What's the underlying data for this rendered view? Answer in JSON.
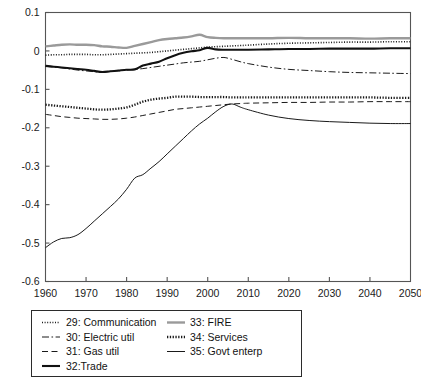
{
  "chart_data": {
    "type": "line",
    "title": "",
    "xlabel": "",
    "ylabel": "",
    "xlim": [
      1960,
      2050
    ],
    "ylim": [
      -0.6,
      0.1
    ],
    "grid": false,
    "legend_position": "below-left",
    "x_ticks": [
      "1960",
      "1970",
      "1980",
      "1990",
      "2000",
      "2010",
      "2020",
      "2030",
      "2040",
      "2050"
    ],
    "x_tick_values": [
      1960,
      1970,
      1980,
      1990,
      2000,
      2010,
      2020,
      2030,
      2040,
      2050
    ],
    "y_ticks": [
      "0.1",
      "0",
      "-0.1",
      "-0.2",
      "-0.3",
      "-0.4",
      "-0.5",
      "-0.6"
    ],
    "y_tick_values": [
      0.1,
      0,
      -0.1,
      -0.2,
      -0.3,
      -0.4,
      -0.5,
      -0.6
    ],
    "x": [
      1960,
      1962,
      1964,
      1966,
      1968,
      1970,
      1972,
      1974,
      1976,
      1978,
      1980,
      1982,
      1984,
      1986,
      1988,
      1990,
      1992,
      1994,
      1996,
      1998,
      2000,
      2002,
      2004,
      2006,
      2008,
      2010,
      2015,
      2020,
      2025,
      2030,
      2035,
      2040,
      2045,
      2050
    ],
    "series": [
      {
        "name": "29: Communication",
        "key": "communication",
        "style": "dotted-fine",
        "color": "#1a1a1a",
        "width": 1.6,
        "dash": "1,1.6",
        "values": [
          -0.011,
          -0.01,
          -0.01,
          -0.009,
          -0.009,
          -0.009,
          -0.01,
          -0.01,
          -0.009,
          -0.008,
          -0.007,
          -0.006,
          -0.005,
          -0.004,
          -0.002,
          0.0,
          0.002,
          0.004,
          0.006,
          0.008,
          0.01,
          0.011,
          0.012,
          0.013,
          0.014,
          0.015,
          0.018,
          0.02,
          0.021,
          0.022,
          0.023,
          0.023,
          0.024,
          0.024
        ]
      },
      {
        "name": "30: Electric util",
        "key": "electric_util",
        "style": "dash-dot",
        "color": "#1a1a1a",
        "width": 1.0,
        "dash": "7,2.5,1.6,2.5",
        "values": [
          -0.04,
          -0.042,
          -0.044,
          -0.047,
          -0.05,
          -0.052,
          -0.054,
          -0.055,
          -0.053,
          -0.052,
          -0.05,
          -0.048,
          -0.046,
          -0.043,
          -0.04,
          -0.037,
          -0.034,
          -0.031,
          -0.029,
          -0.027,
          -0.023,
          -0.019,
          -0.017,
          -0.022,
          -0.028,
          -0.033,
          -0.042,
          -0.048,
          -0.051,
          -0.054,
          -0.056,
          -0.057,
          -0.058,
          -0.059
        ]
      },
      {
        "name": "31: Gas util",
        "key": "gas_util",
        "style": "dashed",
        "color": "#1a1a1a",
        "width": 1.0,
        "dash": "6,3.5",
        "values": [
          -0.165,
          -0.168,
          -0.171,
          -0.173,
          -0.175,
          -0.176,
          -0.177,
          -0.178,
          -0.178,
          -0.177,
          -0.175,
          -0.172,
          -0.168,
          -0.164,
          -0.16,
          -0.156,
          -0.152,
          -0.15,
          -0.148,
          -0.146,
          -0.144,
          -0.142,
          -0.14,
          -0.138,
          -0.137,
          -0.136,
          -0.135,
          -0.134,
          -0.134,
          -0.133,
          -0.133,
          -0.132,
          -0.132,
          -0.132
        ]
      },
      {
        "name": "32:Trade",
        "key": "trade",
        "style": "solid-thick",
        "color": "#111111",
        "width": 2.1,
        "dash": "",
        "values": [
          -0.039,
          -0.041,
          -0.043,
          -0.045,
          -0.047,
          -0.049,
          -0.052,
          -0.055,
          -0.053,
          -0.051,
          -0.049,
          -0.048,
          -0.038,
          -0.033,
          -0.028,
          -0.019,
          -0.011,
          -0.005,
          -0.001,
          0.002,
          0.008,
          0.004,
          0.003,
          0.003,
          0.003,
          0.003,
          0.004,
          0.005,
          0.005,
          0.006,
          0.006,
          0.006,
          0.007,
          0.007
        ]
      },
      {
        "name": "33: FIRE",
        "key": "fire",
        "style": "solid-gray-thick",
        "color": "#9a9a9a",
        "width": 2.4,
        "dash": "",
        "values": [
          0.012,
          0.014,
          0.016,
          0.017,
          0.016,
          0.016,
          0.015,
          0.012,
          0.011,
          0.009,
          0.008,
          0.013,
          0.018,
          0.023,
          0.028,
          0.031,
          0.033,
          0.035,
          0.038,
          0.042,
          0.036,
          0.034,
          0.033,
          0.033,
          0.033,
          0.033,
          0.033,
          0.034,
          0.033,
          0.033,
          0.033,
          0.032,
          0.033,
          0.033
        ]
      },
      {
        "name": "34: Services",
        "key": "services",
        "style": "dotted-bold",
        "color": "#1a1a1a",
        "width": 2.3,
        "dash": "1.3,1.5",
        "values": [
          -0.14,
          -0.142,
          -0.144,
          -0.146,
          -0.148,
          -0.15,
          -0.152,
          -0.153,
          -0.152,
          -0.15,
          -0.147,
          -0.14,
          -0.132,
          -0.127,
          -0.124,
          -0.122,
          -0.119,
          -0.119,
          -0.119,
          -0.12,
          -0.12,
          -0.12,
          -0.12,
          -0.121,
          -0.121,
          -0.121,
          -0.121,
          -0.121,
          -0.121,
          -0.121,
          -0.121,
          -0.121,
          -0.122,
          -0.122
        ]
      },
      {
        "name": "35: Govt enterp",
        "key": "govt_enterp",
        "style": "solid-thin",
        "color": "#1a1a1a",
        "width": 1.0,
        "dash": "",
        "values": [
          -0.512,
          -0.497,
          -0.488,
          -0.486,
          -0.478,
          -0.462,
          -0.443,
          -0.424,
          -0.405,
          -0.385,
          -0.36,
          -0.331,
          -0.322,
          -0.305,
          -0.288,
          -0.268,
          -0.248,
          -0.228,
          -0.208,
          -0.19,
          -0.175,
          -0.158,
          -0.144,
          -0.138,
          -0.146,
          -0.153,
          -0.167,
          -0.176,
          -0.181,
          -0.184,
          -0.186,
          -0.188,
          -0.189,
          -0.189
        ]
      }
    ]
  },
  "legend": {
    "entries": [
      {
        "label": "29: Communication",
        "key": "communication"
      },
      {
        "label": "30: Electric util",
        "key": "electric_util"
      },
      {
        "label": "31: Gas util",
        "key": "gas_util"
      },
      {
        "label": "32:Trade",
        "key": "trade"
      },
      {
        "label": "33: FIRE",
        "key": "fire"
      },
      {
        "label": "34: Services",
        "key": "services"
      },
      {
        "label": "35: Govt enterp",
        "key": "govt_enterp"
      }
    ]
  }
}
